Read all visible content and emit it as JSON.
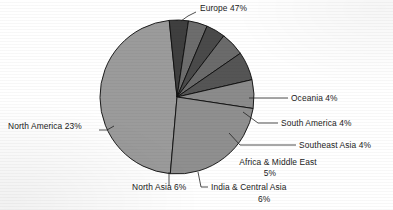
{
  "chart_data": {
    "type": "pie",
    "title": "",
    "subtitle": "",
    "xlabel": "",
    "ylabel": "",
    "legend_position": "none",
    "grid": false,
    "labels_show_percent": true,
    "categories": [
      "Europe",
      "Oceania",
      "South America",
      "Southeast Asia",
      "Africa & Middle East",
      "India & Central Asia",
      "North Asia",
      "North America"
    ],
    "values": [
      47,
      4,
      4,
      4,
      5,
      6,
      6,
      23
    ],
    "units": "%",
    "slices": [
      {
        "name": "Europe",
        "value": 47,
        "label": "Europe 47%",
        "color": "#9b9b9b",
        "start_deg": 185.0,
        "end_deg": 354.2,
        "label_x": 200,
        "label_y": 11,
        "label_anchor": "start",
        "leader": "M 196 12 L 188 16 L 181 21"
      },
      {
        "name": "Oceania",
        "value": 4,
        "label": "Oceania 4%",
        "color": "#3f3f3f",
        "start_deg": 354.2,
        "end_deg": 368.6,
        "label_x": 291,
        "label_y": 101,
        "label_anchor": "start",
        "leader": "M 288 98 L 249 98"
      },
      {
        "name": "South America",
        "value": 4,
        "label": "South America 4%",
        "color": "#6d6d6d",
        "start_deg": 368.6,
        "end_deg": 383.0,
        "label_x": 281,
        "label_y": 126,
        "label_anchor": "start",
        "leader": "M 278 123 L 258 123 L 243 112"
      },
      {
        "name": "Southeast Asia",
        "value": 4,
        "label": "Southeast Asia  4%",
        "color": "#4a4a4a",
        "start_deg": 383.0,
        "end_deg": 397.4,
        "label_x": 299,
        "label_y": 148,
        "label_anchor": "start",
        "leader": "M 296 145 L 240 145 L 229 133"
      },
      {
        "name": "Africa & Middle East",
        "value": 5,
        "label_line1": "Africa & Middle East",
        "label_line2": "5%",
        "label": "Africa & Middle East 5%",
        "color": "#6b6b6b",
        "start_deg": 397.4,
        "end_deg": 415.4,
        "label_x": 278,
        "label_y": 165,
        "label2_x": 270,
        "label2_y": 176,
        "label_anchor": "middle",
        "leader": ""
      },
      {
        "name": "India & Central Asia",
        "value": 6,
        "label_line1": "India & Central Asia",
        "label_line2": "6%",
        "label": "India & Central Asia 6%",
        "color": "#555555",
        "start_deg": 415.4,
        "end_deg": 437.0,
        "label_x": 211,
        "label_y": 190,
        "label2_x": 258,
        "label2_y": 202,
        "label_anchor": "start",
        "leader": "M 208 187 L 201 187 L 198 172"
      },
      {
        "name": "North Asia",
        "value": 6,
        "label": "North Asia 6%",
        "color": "#8b8b8b",
        "start_deg": 437.0,
        "end_deg": 458.6,
        "label_x": 132,
        "label_y": 190,
        "label_anchor": "start",
        "leader": "M 169 186 L 169 172"
      },
      {
        "name": "North America",
        "value": 23,
        "label": "North America 23%",
        "color": "#8f8f8f",
        "start_deg": 458.6,
        "end_deg": 545.0,
        "label_x": 8,
        "label_y": 129,
        "label_anchor": "start",
        "leader": "M 99 130 L 107 130 L 114 126"
      }
    ],
    "geometry": {
      "center_x": 177,
      "center_y": 97,
      "radius": 77
    },
    "style": {
      "background": "#ffffff",
      "outline": "#0d0d0d",
      "text": "#1b1b1b"
    }
  }
}
